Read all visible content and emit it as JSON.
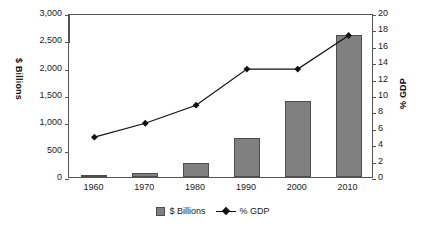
{
  "chart_data": {
    "type": "bar",
    "title": "",
    "subtitle": "",
    "xlabel": "",
    "ylabel": "$ Billions",
    "y2label": "% GDP",
    "categories": [
      "1960",
      "1970",
      "1980",
      "1990",
      "2000",
      "2010"
    ],
    "grid": false,
    "legend_position": "bottom",
    "ylim": [
      0,
      3000
    ],
    "y2lim": [
      0,
      20
    ],
    "yticks": [
      "0",
      "500",
      "1,000",
      "1,500",
      "2,000",
      "2,500",
      "3,000"
    ],
    "ytick_values": [
      0,
      500,
      1000,
      1500,
      2000,
      2500,
      3000
    ],
    "y2ticks": [
      "0",
      "2",
      "4",
      "6",
      "8",
      "10",
      "12",
      "14",
      "16",
      "18",
      "20"
    ],
    "y2tick_values": [
      0,
      2,
      4,
      6,
      8,
      10,
      12,
      14,
      16,
      18,
      20
    ],
    "series": [
      {
        "name": "$ Billions",
        "type": "bar",
        "axis": "left",
        "color": "#808080",
        "values": [
          27,
          75,
          250,
          715,
          1390,
          2600
        ]
      },
      {
        "name": "% GDP",
        "type": "line",
        "axis": "right",
        "color": "#111111",
        "marker": "diamond",
        "values": [
          5.1,
          6.8,
          9.0,
          13.4,
          13.4,
          17.5
        ]
      }
    ]
  },
  "legend": {
    "items": [
      {
        "label": "$ Billions",
        "marker": "bar-swatch"
      },
      {
        "label": "% GDP",
        "marker": "line-diamond-swatch"
      }
    ]
  },
  "axes": {
    "left_title": "$ Billions",
    "right_title": "% GDP"
  }
}
